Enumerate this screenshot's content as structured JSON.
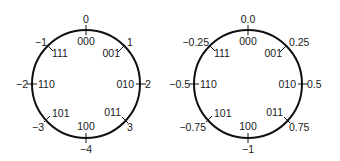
{
  "diagrams": [
    {
      "name": "integer-wheel",
      "outer_labels": [
        "0",
        "1",
        "2",
        "3",
        "-4",
        "-3",
        "-2",
        "-1"
      ],
      "inner_labels": [
        "000",
        "001",
        "010",
        "011",
        "100",
        "101",
        "110",
        "111"
      ]
    },
    {
      "name": "fraction-wheel",
      "outer_labels": [
        "0.0",
        "0.25",
        "0.5",
        "0.75",
        "-1",
        "-0.75",
        "-0.5",
        "-0.25"
      ],
      "inner_labels": [
        "000",
        "001",
        "010",
        "011",
        "100",
        "101",
        "110",
        "111"
      ]
    }
  ]
}
